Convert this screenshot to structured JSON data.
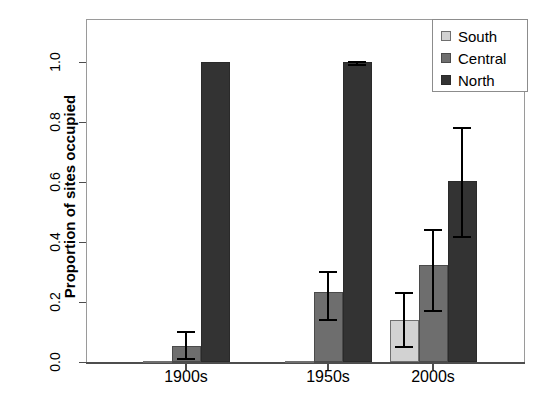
{
  "chart_data": {
    "type": "bar",
    "title": "",
    "subtitle": "",
    "xlabel": "",
    "ylabel": "Proportion of sites occupied",
    "categories": [
      "1900s",
      "1950s",
      "2000s"
    ],
    "ylim": [
      0.0,
      1.05
    ],
    "yticks": [
      0.0,
      0.2,
      0.4,
      0.6,
      0.8,
      1.0
    ],
    "ytick_labels": [
      "0.0",
      "0.2",
      "0.4",
      "0.6",
      "0.8",
      "1.0"
    ],
    "grid": false,
    "legend_position": "top-right",
    "error_bars": "yes",
    "series": [
      {
        "name": "South",
        "color": "#d2d2d2",
        "values": [
          0.002,
          0.005,
          0.14
        ],
        "err_low": [
          0.0,
          0.0,
          0.055
        ],
        "err_high": [
          0.0,
          0.0,
          0.235
        ]
      },
      {
        "name": "Central",
        "color": "#6e6e6e",
        "values": [
          0.055,
          0.232,
          0.325
        ],
        "err_low": [
          0.015,
          0.145,
          0.175
        ],
        "err_high": [
          0.105,
          0.305,
          0.445
        ]
      },
      {
        "name": "North",
        "color": "#333333",
        "values": [
          1.0,
          1.0,
          0.605
        ],
        "err_low": [
          1.0,
          0.995,
          0.42
        ],
        "err_high": [
          1.0,
          1.005,
          0.785
        ]
      }
    ]
  },
  "legend": {
    "items": [
      {
        "label": "South",
        "key": "south"
      },
      {
        "label": "Central",
        "key": "central"
      },
      {
        "label": "North",
        "key": "north"
      }
    ]
  }
}
